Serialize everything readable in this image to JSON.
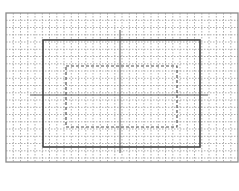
{
  "diagram": {
    "type": "safe-area-guide",
    "canvas": {
      "width": 239,
      "height": 191
    },
    "frame": {
      "x": 6,
      "y": 13,
      "w": 232,
      "h": 149,
      "color": "#8a8a8a"
    },
    "grid": {
      "spacing": 7.25,
      "color": "#9a9a9a"
    },
    "outer_rect": {
      "x": 43,
      "y": 40,
      "w": 157,
      "h": 107,
      "style": "solid",
      "color": "#444444"
    },
    "inner_rect": {
      "x": 66,
      "y": 66,
      "w": 111,
      "h": 61,
      "style": "dashed",
      "color": "#555555"
    },
    "crosshair": {
      "vertical": {
        "x": 120,
        "y1": 30,
        "y2": 153
      },
      "horizontal": {
        "y": 95,
        "x1": 30,
        "x2": 208
      },
      "color": "#555555"
    }
  }
}
